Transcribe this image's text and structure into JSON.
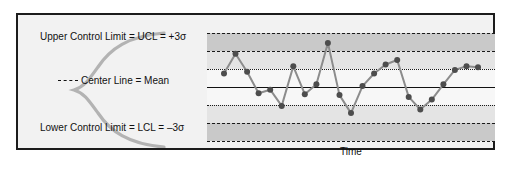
{
  "figure": {
    "background": "#ffffff",
    "panel_background": "#f2f2f2",
    "border_color": "#1c1c1c"
  },
  "labels": {
    "ucl": "Upper Control Limit = UCL = +3σ",
    "lcl": "Lower Control Limit = LCL = –3σ",
    "center": "Center Line = Mean",
    "xaxis": "Time"
  },
  "chart_data": {
    "type": "line",
    "title": "",
    "subtitle": "",
    "xlabel": "Time",
    "ylabel": "",
    "grid": true,
    "legend_position": "none",
    "ylim": [
      -3.6,
      3.6
    ],
    "xlim": [
      0,
      24
    ],
    "control_lines": [
      {
        "name": "UCL",
        "label": "Upper Control Limit = UCL = +3σ",
        "value": 3,
        "style": "dashed",
        "color": "#1a1a1a"
      },
      {
        "name": "+2 sigma",
        "label": "+2σ",
        "value": 2,
        "style": "dashed",
        "color": "#1a1a1a"
      },
      {
        "name": "+1 sigma",
        "label": "+1σ",
        "value": 1,
        "style": "dotted",
        "color": "#1a1a1a"
      },
      {
        "name": "Center Line",
        "label": "Center Line = Mean",
        "value": 0,
        "style": "solid",
        "color": "#111111"
      },
      {
        "name": "-1 sigma",
        "label": "–1σ",
        "value": -1,
        "style": "dotted",
        "color": "#1a1a1a"
      },
      {
        "name": "-2 sigma",
        "label": "–2σ",
        "value": -2,
        "style": "dashed",
        "color": "#1a1a1a"
      },
      {
        "name": "LCL",
        "label": "Lower Control Limit = LCL = –3σ",
        "value": -3,
        "style": "dashed",
        "color": "#1a1a1a"
      }
    ],
    "zones": [
      {
        "name": "Zone A upper",
        "from": 2,
        "to": 3,
        "color": "#c9c9c9"
      },
      {
        "name": "Zone B upper",
        "from": 1,
        "to": 2,
        "color": "#e4e4e4"
      },
      {
        "name": "Zone C upper",
        "from": 0,
        "to": 1,
        "color": "#f7f7f7"
      },
      {
        "name": "Zone C lower",
        "from": -1,
        "to": 0,
        "color": "#f7f7f7"
      },
      {
        "name": "Zone B lower",
        "from": -2,
        "to": -1,
        "color": "#e4e4e4"
      },
      {
        "name": "Zone A lower",
        "from": -3,
        "to": -2,
        "color": "#c9c9c9"
      }
    ],
    "series": [
      {
        "name": "Process measurement",
        "color": "#8c8c8c",
        "marker_color": "#4d4d4d",
        "x": [
          0,
          1,
          2,
          3,
          4,
          5,
          6,
          7,
          8,
          9,
          10,
          11,
          12,
          13,
          14,
          15,
          16,
          17,
          18,
          19,
          20,
          21,
          22
        ],
        "values": [
          0.75,
          1.85,
          0.85,
          -0.35,
          -0.15,
          -1.05,
          1.15,
          -0.4,
          0.15,
          2.45,
          -0.45,
          -1.45,
          0.05,
          0.75,
          1.25,
          1.5,
          -0.55,
          -1.25,
          -0.7,
          0.15,
          0.95,
          1.15,
          1.1
        ]
      }
    ]
  },
  "bell_curve": {
    "name": "normal-distribution-curve",
    "color": "#b3b3b3",
    "orientation": "vertical"
  }
}
